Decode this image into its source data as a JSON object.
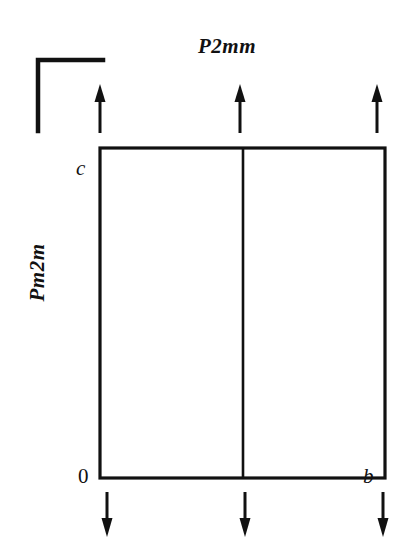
{
  "figure": {
    "type": "crystallographic-symmetry-diagram",
    "background_color": "#ffffff",
    "stroke_color": "#111111",
    "labels": {
      "top_symmetry": "P2mm",
      "left_symmetry": "Pm2m",
      "axis_vertical": "c",
      "axis_horizontal": "b",
      "origin": "0"
    },
    "unit_cell": {
      "left": 100,
      "top": 148,
      "right": 385,
      "bottom": 478,
      "mirror_line_x": 243,
      "border_width": 3
    },
    "corner_bracket": {
      "vertex_x": 38,
      "vertex_y": 60,
      "arm_right_x": 103,
      "arm_down_y": 131,
      "stroke_width": 4
    },
    "arrows_top": [
      {
        "name": "top-arrow-left",
        "x": 100,
        "y_tail": 133,
        "y_head": 85,
        "direction": "up"
      },
      {
        "name": "top-arrow-center",
        "x": 240,
        "y_tail": 133,
        "y_head": 85,
        "direction": "up"
      },
      {
        "name": "top-arrow-right",
        "x": 377,
        "y_tail": 133,
        "y_head": 85,
        "direction": "up"
      }
    ],
    "arrows_bottom": [
      {
        "name": "bottom-arrow-left",
        "x": 107,
        "y_tail": 492,
        "y_head": 536,
        "direction": "down"
      },
      {
        "name": "bottom-arrow-center",
        "x": 245,
        "y_tail": 492,
        "y_head": 536,
        "direction": "down"
      },
      {
        "name": "bottom-arrow-right",
        "x": 383,
        "y_tail": 492,
        "y_head": 536,
        "direction": "down"
      }
    ]
  }
}
